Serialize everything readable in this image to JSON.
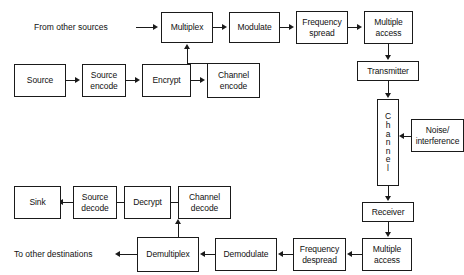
{
  "diagram": {
    "stroke_color": "#1a1a1a",
    "text_color": "#111111",
    "background_color": "#ffffff",
    "labels": {
      "from_other_sources": "From other sources",
      "to_other_destinations": "To other destinations"
    },
    "blocks": {
      "multiplex": "Multiplex",
      "modulate": "Modulate",
      "frequency_spread": "Frequency\nspread",
      "multiple_access_tx": "Multiple\naccess",
      "transmitter": "Transmitter",
      "source": "Source",
      "source_encode": "Source\nencode",
      "encrypt": "Encrypt",
      "channel_encode": "Channel\nencode",
      "channel": "Channel",
      "channel_letters": [
        "C",
        "h",
        "a",
        "n",
        "n",
        "e",
        "l"
      ],
      "noise_interference": "Noise/\ninterference",
      "receiver": "Receiver",
      "multiple_access_rx": "Multiple\naccess",
      "frequency_despread": "Frequency\ndespread",
      "demodulate": "Demodulate",
      "demultiplex": "Demultiplex",
      "channel_decode": "Channel\ndecode",
      "decrypt": "Decrypt",
      "source_decode": "Source\ndecode",
      "sink": "Sink"
    }
  }
}
